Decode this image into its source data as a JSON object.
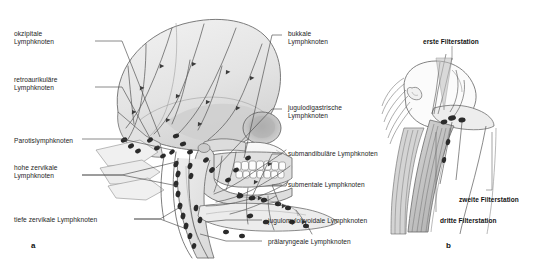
{
  "figure": {
    "background_color": "#ffffff",
    "text_color": "#1d1d1d",
    "line_color": "#4a4a4a",
    "bone_fill": "#e9e9e9",
    "shade_fill": "#c9c9c9",
    "node_color": "#2a2a2a"
  },
  "panels": [
    {
      "id": "a",
      "mark": "a"
    },
    {
      "id": "b",
      "mark": "b"
    }
  ],
  "panel_a": {
    "mark": "a",
    "labels_left": [
      {
        "key": "okzipitale",
        "text": "okzipitale\nLymphknoten",
        "x": 14,
        "y": 30
      },
      {
        "key": "retroaurikulaere",
        "text": "retroaurikuläre\nLymphknoten",
        "x": 14,
        "y": 76
      },
      {
        "key": "parotis",
        "text": "Parotislymphknoten",
        "x": 14,
        "y": 137
      },
      {
        "key": "hohe-zervikale",
        "text": "hohe zervikale\nLymphknoten",
        "x": 14,
        "y": 164
      },
      {
        "key": "tiefe-zervikale",
        "text": "tiefe zervikale Lymphknoten",
        "x": 14,
        "y": 216
      }
    ],
    "labels_right": [
      {
        "key": "bukkale",
        "text": "bukkale\nLymphknoten",
        "x": 288,
        "y": 30
      },
      {
        "key": "jugulodigastrische",
        "text": "jugulodigastrische\nLymphknoten",
        "x": 288,
        "y": 104
      },
      {
        "key": "submandibulaere",
        "text": "submandibuläre Lymphknoten",
        "x": 288,
        "y": 150
      },
      {
        "key": "submentale",
        "text": "submentale Lymphknoten",
        "x": 288,
        "y": 181
      },
      {
        "key": "jugulomylohyoidale",
        "text": "jugulomylohyoidale Lymphknoten",
        "x": 268,
        "y": 217
      },
      {
        "key": "praelaryngeale",
        "text": "prälaryngeale Lymphknoten",
        "x": 268,
        "y": 238
      }
    ]
  },
  "panel_b": {
    "mark": "b",
    "labels": [
      {
        "key": "erste-filterstation",
        "text": "erste Filterstation",
        "x": 423,
        "y": 38,
        "bold": true
      },
      {
        "key": "zweite-filterstation",
        "text": "zweite Filterstation",
        "x": 459,
        "y": 196,
        "bold": true
      },
      {
        "key": "dritte-filterstation",
        "text": "dritte Filterstation",
        "x": 440,
        "y": 217,
        "bold": true
      }
    ]
  }
}
